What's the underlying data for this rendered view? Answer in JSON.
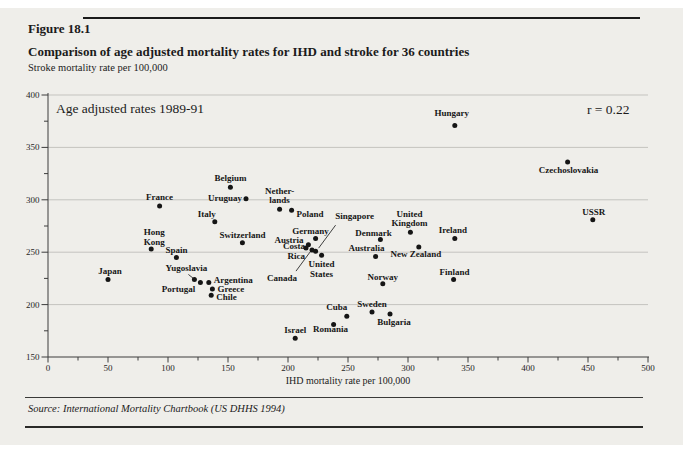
{
  "page": {
    "background_color": "#efeeea",
    "header": {
      "figure_label": "Figure 18.1",
      "title": "Comparison of age adjusted mortality rates for IHD and stroke for 36 countries",
      "subtitle": "Stroke mortality rate per 100,000"
    },
    "footer": {
      "source": "Source: International Mortality Chartbook (US DHHS 1994)"
    }
  },
  "chart_data": {
    "type": "scatter",
    "title": "Comparison of age adjusted mortality rates for IHD and stroke for 36 countries",
    "annotation": "Age adjusted rates 1989-91",
    "correlation_label": "r = 0.22",
    "xlabel": "IHD mortality rate per 100,000",
    "ylabel": "Stroke mortality rate per 100,000",
    "xlim": [
      0,
      500
    ],
    "ylim": [
      150,
      400
    ],
    "x_ticks": [
      0,
      50,
      100,
      150,
      200,
      250,
      300,
      350,
      400,
      450,
      500
    ],
    "y_ticks": [
      150,
      200,
      250,
      300,
      350,
      400
    ],
    "x_minor_step": 25,
    "y_minor_step": 25,
    "gridlines_y": [
      200,
      250,
      300,
      350,
      400
    ],
    "grid": "horizontal-only",
    "legend": "none",
    "marker_color": "#151515",
    "gridline_color": "#c4c3bf",
    "points": [
      {
        "country": "Japan",
        "ihd": 50,
        "stroke": 224,
        "label": {
          "anchor": "above",
          "dx": 2,
          "dy": 1
        }
      },
      {
        "country": "Hong Kong",
        "ihd": 86,
        "stroke": 253,
        "label": {
          "anchor": "above",
          "dx": 3,
          "dy": 2,
          "text": "Hong\nKong"
        }
      },
      {
        "country": "France",
        "ihd": 93,
        "stroke": 294,
        "label": {
          "anchor": "above",
          "dx": 0,
          "dy": 0
        }
      },
      {
        "country": "Spain",
        "ihd": 107,
        "stroke": 245,
        "label": {
          "anchor": "above",
          "dx": 0,
          "dy": 2
        }
      },
      {
        "country": "Yugoslavia",
        "ihd": 122,
        "stroke": 224,
        "label": {
          "anchor": "above",
          "dx": -8,
          "dy": -2,
          "pointer": [
            -6,
            -5,
            -1,
            -1
          ]
        }
      },
      {
        "country": "Portugal",
        "ihd": 127,
        "stroke": 221,
        "label": {
          "anchor": "below",
          "dx": -22,
          "dy": -3
        }
      },
      {
        "country": "Argentina",
        "ihd": 134,
        "stroke": 221,
        "label": {
          "anchor": "right",
          "dx": 0,
          "dy": -3
        }
      },
      {
        "country": "Chile",
        "ihd": 136,
        "stroke": 209,
        "label": {
          "anchor": "right",
          "dx": 0,
          "dy": 2
        }
      },
      {
        "country": "Greece",
        "ihd": 137,
        "stroke": 215,
        "label": {
          "anchor": "right",
          "dx": 0,
          "dy": 0
        }
      },
      {
        "country": "Italy",
        "ihd": 139,
        "stroke": 279,
        "label": {
          "anchor": "above",
          "dx": -8,
          "dy": 1
        }
      },
      {
        "country": "Belgium",
        "ihd": 152,
        "stroke": 312,
        "label": {
          "anchor": "above",
          "dx": 0,
          "dy": 0
        }
      },
      {
        "country": "Switzerland",
        "ihd": 162,
        "stroke": 259,
        "label": {
          "anchor": "above",
          "dx": 0,
          "dy": 1
        }
      },
      {
        "country": "Uruguay",
        "ihd": 165,
        "stroke": 301,
        "label": {
          "anchor": "left",
          "dx": 1,
          "dy": -1
        }
      },
      {
        "country": "Netherlands",
        "ihd": 193,
        "stroke": 291,
        "label": {
          "anchor": "above",
          "dx": 0,
          "dy": 0,
          "text": "Nether-\nlands"
        }
      },
      {
        "country": "Poland",
        "ihd": 203,
        "stroke": 290,
        "label": {
          "anchor": "right",
          "dx": 0,
          "dy": 4
        }
      },
      {
        "country": "Israel",
        "ihd": 206,
        "stroke": 168,
        "label": {
          "anchor": "above",
          "dx": 0,
          "dy": 1
        }
      },
      {
        "country": "Costa Rica",
        "ihd": 215,
        "stroke": 254,
        "label": {
          "anchor": "left",
          "dx": 4,
          "dy": 3,
          "text": "Costa\nRica"
        }
      },
      {
        "country": "Austria",
        "ihd": 217,
        "stroke": 257,
        "label": {
          "anchor": "left",
          "dx": 0,
          "dy": -5
        }
      },
      {
        "country": "Canada",
        "ihd": 220,
        "stroke": 252,
        "label": {
          "anchor": "below",
          "dx": -30,
          "dy": 19,
          "pointer": [
            -2,
            2,
            -16,
            21
          ]
        }
      },
      {
        "country": "Singapore",
        "ihd": 223,
        "stroke": 251,
        "label": {
          "anchor": "above",
          "dx": 39,
          "dy": -26,
          "pointer": [
            3,
            -3,
            20,
            -26
          ]
        }
      },
      {
        "country": "Germany",
        "ihd": 223,
        "stroke": 263,
        "label": {
          "anchor": "above",
          "dx": -5,
          "dy": 1
        }
      },
      {
        "country": "United States",
        "ihd": 228,
        "stroke": 247,
        "label": {
          "anchor": "below",
          "dx": 0,
          "dy": 0,
          "text": "United\nStates"
        }
      },
      {
        "country": "Romania",
        "ihd": 238,
        "stroke": 181,
        "label": {
          "anchor": "below",
          "dx": -3,
          "dy": -5
        }
      },
      {
        "country": "Cuba",
        "ihd": 249,
        "stroke": 189,
        "label": {
          "anchor": "above",
          "dx": -10,
          "dy": 0
        }
      },
      {
        "country": "Sweden",
        "ihd": 270,
        "stroke": 193,
        "label": {
          "anchor": "above",
          "dx": 0,
          "dy": 1
        }
      },
      {
        "country": "Australia",
        "ihd": 273,
        "stroke": 246,
        "label": {
          "anchor": "above",
          "dx": -9,
          "dy": 1
        }
      },
      {
        "country": "Denmark",
        "ihd": 277,
        "stroke": 262,
        "label": {
          "anchor": "above",
          "dx": -7,
          "dy": 2
        }
      },
      {
        "country": "Norway",
        "ihd": 279,
        "stroke": 220,
        "label": {
          "anchor": "above",
          "dx": 0,
          "dy": 2
        }
      },
      {
        "country": "Bulgaria",
        "ihd": 285,
        "stroke": 191,
        "label": {
          "anchor": "below",
          "dx": 4,
          "dy": -1
        }
      },
      {
        "country": "United Kingdom",
        "ihd": 302,
        "stroke": 269,
        "label": {
          "anchor": "above",
          "dx": -1,
          "dy": 0,
          "text": "United\nKingdom"
        }
      },
      {
        "country": "New Zealand",
        "ihd": 309,
        "stroke": 255,
        "label": {
          "anchor": "below",
          "dx": -3,
          "dy": -2
        }
      },
      {
        "country": "Finland",
        "ihd": 338,
        "stroke": 224,
        "label": {
          "anchor": "above",
          "dx": 1,
          "dy": 2
        }
      },
      {
        "country": "Ireland",
        "ihd": 339,
        "stroke": 263,
        "label": {
          "anchor": "above",
          "dx": -2,
          "dy": 0
        }
      },
      {
        "country": "Hungary",
        "ihd": 339,
        "stroke": 371,
        "label": {
          "anchor": "above",
          "dx": -3,
          "dy": -3
        }
      },
      {
        "country": "Czechoslovakia",
        "ihd": 433,
        "stroke": 336,
        "label": {
          "anchor": "below",
          "dx": 1,
          "dy": -1
        }
      },
      {
        "country": "USSR",
        "ihd": 454,
        "stroke": 281,
        "label": {
          "anchor": "above",
          "dx": 1,
          "dy": 1
        }
      }
    ]
  }
}
